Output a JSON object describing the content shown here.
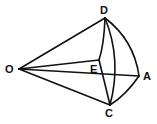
{
  "diagram": {
    "type": "geometric-figure",
    "points": {
      "O": {
        "label": "O",
        "x": 19,
        "y": 69
      },
      "D": {
        "label": "D",
        "x": 105,
        "y": 18
      },
      "E": {
        "label": "E",
        "x": 99,
        "y": 60
      },
      "A": {
        "label": "A",
        "x": 139,
        "y": 76
      },
      "C": {
        "label": "C",
        "x": 110,
        "y": 105
      }
    },
    "labels": {
      "O": "O",
      "D": "D",
      "E": "E",
      "A": "A",
      "C": "C"
    },
    "edges": [
      {
        "from": "O",
        "to": "D",
        "kind": "straight"
      },
      {
        "from": "O",
        "to": "E",
        "kind": "straight"
      },
      {
        "from": "O",
        "to": "A",
        "kind": "straight"
      },
      {
        "from": "O",
        "to": "C",
        "kind": "straight"
      },
      {
        "from": "D",
        "to": "E",
        "kind": "arc"
      },
      {
        "from": "E",
        "to": "C",
        "kind": "arc"
      },
      {
        "from": "D",
        "to": "C",
        "kind": "arc"
      },
      {
        "from": "D",
        "to": "A",
        "kind": "arc"
      },
      {
        "from": "A",
        "to": "C",
        "kind": "arc"
      }
    ],
    "colors": {
      "stroke": "#111111",
      "background": "#ffffff"
    }
  }
}
